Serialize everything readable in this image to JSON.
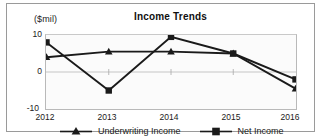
{
  "chart_data": {
    "type": "line",
    "title": "Income Trends",
    "xlabel": "",
    "ylabel": "($mil)",
    "categories": [
      "2012",
      "2013",
      "2014",
      "2015",
      "2016"
    ],
    "x": [
      2012,
      2013,
      2014,
      2015,
      2016
    ],
    "ylim": [
      -10,
      10
    ],
    "yticks": [
      "10",
      "0",
      "-10"
    ],
    "ytick_values": [
      10,
      0,
      -10
    ],
    "grid": true,
    "legend_position": "bottom",
    "series": [
      {
        "name": "Underwriting Income",
        "marker": "triangle",
        "color": "#1a1a1a",
        "values": [
          4.0,
          5.5,
          5.5,
          5.0,
          -4.5
        ]
      },
      {
        "name": "Net Income",
        "marker": "square",
        "color": "#1a1a1a",
        "values": [
          8.0,
          -5.0,
          9.5,
          5.0,
          -2.0
        ]
      }
    ]
  },
  "figure": {
    "title": "Income Trends",
    "unit_caption": "($mil)",
    "frame_color": "#9a9a9a",
    "plot_background": "#fbfbfb",
    "axis_color": "#b9b9b9",
    "text_color": "#1a1a1a"
  },
  "y_axis": {
    "ticks": [
      "10",
      "0",
      "-10"
    ]
  },
  "x_axis": {
    "ticks": [
      "2012",
      "2013",
      "2014",
      "2015",
      "2016"
    ]
  },
  "legend": {
    "items": [
      {
        "label": "Underwriting Income",
        "marker": "triangle-marker"
      },
      {
        "label": "Net Income",
        "marker": "square-marker"
      }
    ]
  }
}
